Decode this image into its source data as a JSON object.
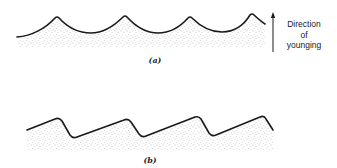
{
  "figure": {
    "panels": [
      {
        "id": "a",
        "label": "(a)",
        "description": "Symmetric ripple marks, sharp crests pointing up",
        "crests_x": [
          57,
          125,
          190,
          252
        ]
      },
      {
        "id": "b",
        "label": "(b)",
        "description": "Asymmetric ripple marks, steep lee faces",
        "crests_x": [
          58,
          127,
          198,
          263
        ]
      }
    ],
    "annotation": {
      "lines": [
        "Direction",
        "of",
        "younging"
      ],
      "arrow": "up-arrow"
    },
    "colors": {
      "line": "#1a1a1a",
      "stipple": "#8a8a8a",
      "background": "#ffffff"
    }
  }
}
